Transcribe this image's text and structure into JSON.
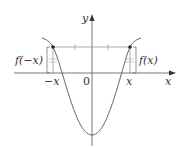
{
  "diagram": {
    "axes": {
      "x_label": "x",
      "y_label": "y",
      "origin_label": "0"
    },
    "points": {
      "left_tick_label": "−x",
      "right_tick_label": "x"
    },
    "brackets": {
      "left_label": "f(−x)",
      "right_label": "f(x)"
    },
    "colors": {
      "curve": "#555555",
      "axes": "#555555",
      "guide": "#888888",
      "point": "#222222",
      "text": "#333333"
    }
  }
}
